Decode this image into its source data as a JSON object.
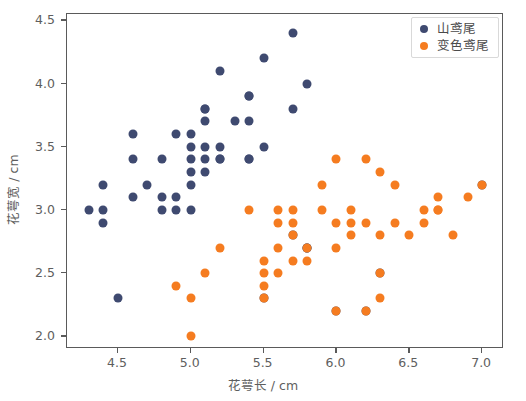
{
  "chart_data": {
    "type": "scatter",
    "title": "",
    "xlabel": "花萼长 / cm",
    "ylabel": "花萼宽 / cm",
    "xlim": [
      4.15,
      7.15
    ],
    "ylim": [
      1.9,
      4.55
    ],
    "xticks": [
      "4.5",
      "5.0",
      "5.5",
      "6.0",
      "6.5",
      "7.0"
    ],
    "xtick_values": [
      4.5,
      5.0,
      5.5,
      6.0,
      6.5,
      7.0
    ],
    "yticks": [
      "2.0",
      "2.5",
      "3.0",
      "3.5",
      "4.0",
      "4.5"
    ],
    "ytick_values": [
      2.0,
      2.5,
      3.0,
      3.5,
      4.0,
      4.5
    ],
    "grid": false,
    "legend_position": "upper right",
    "marker": "circle",
    "series": [
      {
        "name": "山鸢尾",
        "color": "#3f4a70",
        "points": [
          [
            4.3,
            3.0
          ],
          [
            4.4,
            3.2
          ],
          [
            4.4,
            3.0
          ],
          [
            4.4,
            2.9
          ],
          [
            4.5,
            2.3
          ],
          [
            4.6,
            3.6
          ],
          [
            4.6,
            3.4
          ],
          [
            4.6,
            3.1
          ],
          [
            4.7,
            3.2
          ],
          [
            4.8,
            3.4
          ],
          [
            4.8,
            3.1
          ],
          [
            4.8,
            3.0
          ],
          [
            4.9,
            3.6
          ],
          [
            4.9,
            3.1
          ],
          [
            4.9,
            3.0
          ],
          [
            5.0,
            3.6
          ],
          [
            5.0,
            3.5
          ],
          [
            5.0,
            3.4
          ],
          [
            5.0,
            3.3
          ],
          [
            5.0,
            3.2
          ],
          [
            5.0,
            3.0
          ],
          [
            5.1,
            3.8
          ],
          [
            5.1,
            3.8
          ],
          [
            5.1,
            3.7
          ],
          [
            5.1,
            3.5
          ],
          [
            5.1,
            3.4
          ],
          [
            5.1,
            3.3
          ],
          [
            5.2,
            4.1
          ],
          [
            5.2,
            3.5
          ],
          [
            5.2,
            3.4
          ],
          [
            5.2,
            3.4
          ],
          [
            5.3,
            3.7
          ],
          [
            5.4,
            3.9
          ],
          [
            5.4,
            3.7
          ],
          [
            5.4,
            3.4
          ],
          [
            5.4,
            3.4
          ],
          [
            5.4,
            3.9
          ],
          [
            5.5,
            4.2
          ],
          [
            5.5,
            3.5
          ],
          [
            5.5,
            2.3
          ],
          [
            5.7,
            4.4
          ],
          [
            5.7,
            3.8
          ],
          [
            5.7,
            2.8
          ],
          [
            5.8,
            4.0
          ],
          [
            5.8,
            2.7
          ],
          [
            5.8,
            2.7
          ],
          [
            6.0,
            2.2
          ],
          [
            6.2,
            2.2
          ],
          [
            6.3,
            2.5
          ],
          [
            7.0,
            3.2
          ]
        ]
      },
      {
        "name": "变色鸢尾",
        "color": "#f57c20",
        "points": [
          [
            4.9,
            2.4
          ],
          [
            5.0,
            2.0
          ],
          [
            5.0,
            2.3
          ],
          [
            5.1,
            2.5
          ],
          [
            5.2,
            2.7
          ],
          [
            5.4,
            3.0
          ],
          [
            5.5,
            2.6
          ],
          [
            5.5,
            2.5
          ],
          [
            5.5,
            2.4
          ],
          [
            5.5,
            2.3
          ],
          [
            5.6,
            3.0
          ],
          [
            5.6,
            2.9
          ],
          [
            5.6,
            2.7
          ],
          [
            5.6,
            2.5
          ],
          [
            5.7,
            3.0
          ],
          [
            5.7,
            2.9
          ],
          [
            5.7,
            2.8
          ],
          [
            5.7,
            2.6
          ],
          [
            5.8,
            2.7
          ],
          [
            5.8,
            2.6
          ],
          [
            5.9,
            3.2
          ],
          [
            5.9,
            3.0
          ],
          [
            6.0,
            3.4
          ],
          [
            6.0,
            2.9
          ],
          [
            6.0,
            2.7
          ],
          [
            6.0,
            2.2
          ],
          [
            6.1,
            3.0
          ],
          [
            6.1,
            2.9
          ],
          [
            6.1,
            2.8
          ],
          [
            6.2,
            3.4
          ],
          [
            6.2,
            2.9
          ],
          [
            6.2,
            2.2
          ],
          [
            6.3,
            3.3
          ],
          [
            6.3,
            2.8
          ],
          [
            6.3,
            2.5
          ],
          [
            6.3,
            2.3
          ],
          [
            6.4,
            3.2
          ],
          [
            6.4,
            2.9
          ],
          [
            6.5,
            2.8
          ],
          [
            6.6,
            3.0
          ],
          [
            6.6,
            2.9
          ],
          [
            6.7,
            3.1
          ],
          [
            6.7,
            3.0
          ],
          [
            6.7,
            3.0
          ],
          [
            6.8,
            2.8
          ],
          [
            6.9,
            3.1
          ],
          [
            7.0,
            3.2
          ]
        ]
      }
    ]
  },
  "legend": {
    "entries": [
      {
        "label": "山鸢尾",
        "color": "#3f4a70"
      },
      {
        "label": "变色鸢尾",
        "color": "#f57c20"
      }
    ]
  }
}
